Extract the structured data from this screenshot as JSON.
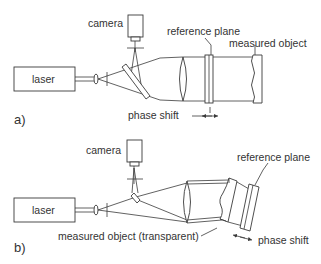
{
  "diagram_a": {
    "panel_label": "a)",
    "labels": {
      "laser": "laser",
      "camera": "camera",
      "reference_plane": "reference plane",
      "measured_object": "measured object",
      "phase_shift": "phase shift"
    }
  },
  "diagram_b": {
    "panel_label": "b)",
    "labels": {
      "laser": "laser",
      "camera": "camera",
      "reference_plane": "reference plane",
      "measured_object": "measured object (transparent)",
      "phase_shift": "phase shift"
    }
  },
  "colors": {
    "line": "#3a3a3a",
    "text": "#333333",
    "background": "#ffffff"
  }
}
